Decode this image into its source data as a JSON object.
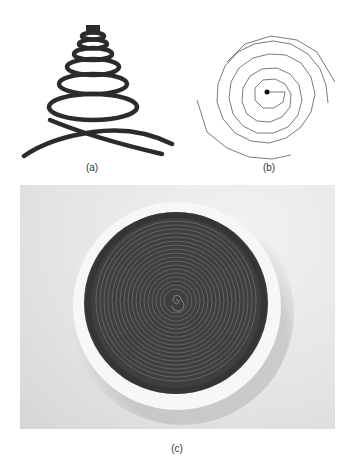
{
  "figure": {
    "panels": [
      {
        "id": "a",
        "label": "(a)",
        "description": "Conical helix (side view) drawn with thick dark stroke",
        "stroke_color": "#2b2b2b"
      },
      {
        "id": "b",
        "label": "(b)",
        "description": "Planar polygonal spiral (top view) with center dot",
        "stroke_color": "#7a7a7a"
      },
      {
        "id": "c",
        "label": "(c)",
        "description": "Photograph of a dark coiled spiral inside a white circular dish on light background",
        "background_color": "#e6e6e6",
        "dish_color": "#f7f7f7",
        "coil_color": "#4a4a4a"
      }
    ]
  }
}
